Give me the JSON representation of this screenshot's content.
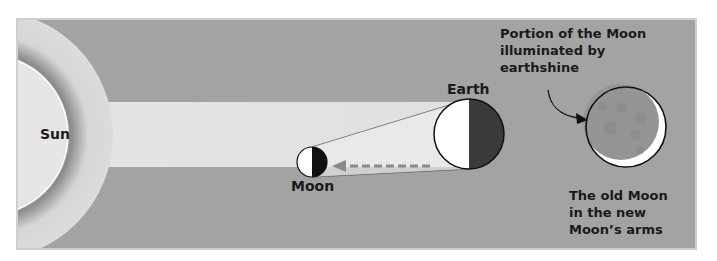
{
  "diagram": {
    "labels": {
      "sun": "Sun",
      "earth": "Earth",
      "moon": "Moon",
      "earthshine_line1": "Portion of the Moon",
      "earthshine_line2": "illuminated by",
      "earthshine_line3": "earthshine",
      "old_moon_line1": "The old Moon",
      "old_moon_line2": "in the new",
      "old_moon_line3": "Moon’s arms"
    },
    "colors": {
      "panel_background": "#a3a3a3",
      "panel_border": "#cfcfcf",
      "sun_fill": "#e6e6e6",
      "light_beam": "#e2e2e2",
      "corona": "#d4d4d4",
      "lit_side": "#ffffff",
      "dark_side": "#3a3a3a",
      "arrow": "#8a8a8a",
      "old_moon_fill": "#959595",
      "crescent": "#ffffff"
    },
    "elements": [
      {
        "name": "Sun",
        "shape": "large partial circle with corona",
        "position": "left edge"
      },
      {
        "name": "Earth",
        "shape": "circle, left half lit, right half dark"
      },
      {
        "name": "Moon",
        "shape": "small circle, left half lit, right half dark"
      },
      {
        "name": "earthshine arrow",
        "shape": "dashed arrow from Earth to Moon"
      },
      {
        "name": "Old Moon",
        "shape": "gray disk with thin bright crescent at lower right"
      }
    ]
  }
}
